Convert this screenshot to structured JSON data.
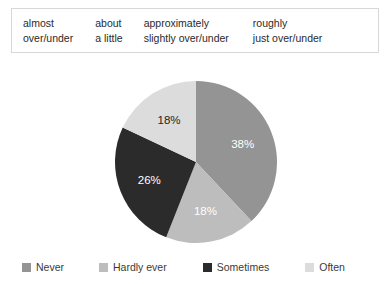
{
  "phrase_box": {
    "columns": [
      {
        "line1": "almost",
        "line2": "over/under"
      },
      {
        "line1": "about",
        "line2": "a little"
      },
      {
        "line1": "approximately",
        "line2": "slightly over/under"
      },
      {
        "line1": "roughly",
        "line2": "just over/under"
      }
    ]
  },
  "chart_data": {
    "type": "pie",
    "title": "",
    "categories": [
      "Never",
      "Hardly ever",
      "Sometimes",
      "Often"
    ],
    "values": [
      38,
      18,
      26,
      18
    ],
    "value_labels": [
      "38%",
      "18%",
      "26%",
      "18%"
    ],
    "colors": [
      "#949494",
      "#bdbdbd",
      "#2b2b2b",
      "#dcdcdc"
    ],
    "label_colors": [
      "#ffffff",
      "#ffffff",
      "#ffffff",
      "#231f20"
    ],
    "units": "percent",
    "start_angle_deg": 0,
    "direction": "clockwise",
    "legend_position": "bottom",
    "grid": false
  },
  "legend": {
    "items": [
      {
        "label": "Never",
        "color": "#949494"
      },
      {
        "label": "Hardly ever",
        "color": "#bdbdbd"
      },
      {
        "label": "Sometimes",
        "color": "#2b2b2b"
      },
      {
        "label": "Often",
        "color": "#dcdcdc"
      }
    ]
  }
}
